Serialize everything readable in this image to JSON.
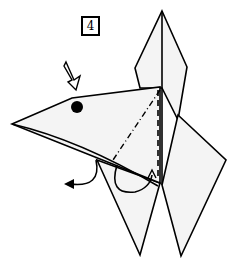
{
  "diagram": {
    "type": "origami-step",
    "step_number": "4",
    "colors": {
      "paper": "#f4f4f4",
      "line": "#000000",
      "background": "#ffffff"
    },
    "elements": [
      {
        "name": "step-number-box",
        "text": "4"
      },
      {
        "name": "push-arrow",
        "meaning": "sink/push down"
      },
      {
        "name": "eye-dot"
      },
      {
        "name": "mountain-fold-line",
        "style": "dash-dot"
      },
      {
        "name": "valley-fold-line",
        "style": "dashed"
      },
      {
        "name": "fold-behind-arrow"
      },
      {
        "name": "fold-under-arrow"
      }
    ]
  }
}
